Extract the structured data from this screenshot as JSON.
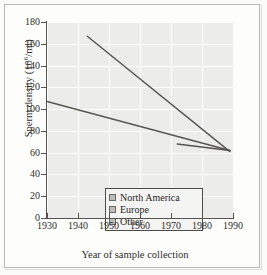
{
  "figure": {
    "background_color": "#fdfdfc",
    "frame_color": "#b9b9b5"
  },
  "chart_data": {
    "type": "line",
    "title": "",
    "xlabel": "Year of sample collection",
    "ylabel": "Sperm density (10⁶/ml)",
    "ylabel_base": "Sperm density (10",
    "ylabel_exp": "6",
    "ylabel_tail": "/ml)",
    "xlim": [
      1930,
      1990
    ],
    "ylim": [
      0,
      180
    ],
    "xticks": [
      1930,
      1940,
      1950,
      1960,
      1970,
      1980,
      1990
    ],
    "yticks": [
      0,
      20,
      40,
      60,
      80,
      100,
      120,
      140,
      160,
      180
    ],
    "grid": true,
    "grid_color": "#ffffff",
    "plot_background": "#ececeb",
    "legend_position": "lower left",
    "line_color": "#55544f",
    "series": [
      {
        "name": "North America",
        "swatch_color": "#bdbdba",
        "x": [
          1943,
          1989
        ],
        "y": [
          167,
          61
        ]
      },
      {
        "name": "Europe",
        "swatch_color": "#bdbdba",
        "x": [
          1930,
          1989
        ],
        "y": [
          107,
          62
        ]
      },
      {
        "name": "Other",
        "swatch_color": "#bdbdba",
        "x": [
          1972,
          1989
        ],
        "y": [
          68,
          62
        ]
      }
    ]
  },
  "legend": {
    "items": [
      {
        "label": "North America"
      },
      {
        "label": "Europe"
      },
      {
        "label": "Other"
      }
    ]
  },
  "axis_labels": {
    "y": [
      "180",
      "160",
      "140",
      "120",
      "100",
      "80",
      "60",
      "40",
      "20",
      "0"
    ],
    "x": [
      "1930",
      "1940",
      "1950",
      "1960",
      "1970",
      "1980",
      "1990"
    ]
  }
}
